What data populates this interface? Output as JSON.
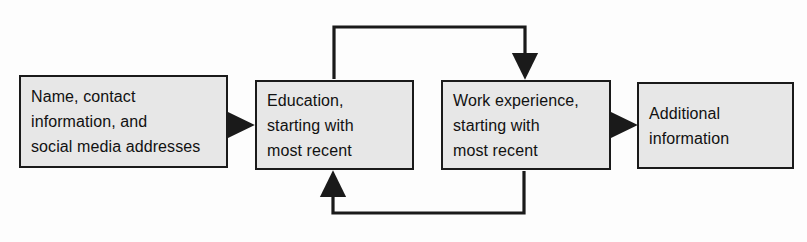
{
  "diagram": {
    "background_color": "#fdfdfd",
    "box_fill_color": "#e7e7e7",
    "box_border_color": "#1a1a1a",
    "arrow_color": "#1a1a1a",
    "boxes": [
      {
        "id": "contact",
        "name": "contact-information-box",
        "lines": [
          "Name, contact",
          "information, and",
          "social media addresses"
        ]
      },
      {
        "id": "education",
        "name": "education-box",
        "lines": [
          "Education,",
          "starting with",
          "most recent"
        ]
      },
      {
        "id": "work",
        "name": "work-experience-box",
        "lines": [
          "Work experience,",
          "starting with",
          "most recent"
        ]
      },
      {
        "id": "additional",
        "name": "additional-information-box",
        "lines": [
          "Additional",
          "information"
        ]
      }
    ],
    "connectors": [
      {
        "id": "contact-to-education",
        "from": "contact",
        "to": "education",
        "kind": "straight-arrow-right"
      },
      {
        "id": "education-to-work-top",
        "from": "education",
        "to": "work",
        "kind": "elbow-arrow-over-top"
      },
      {
        "id": "work-to-education-bottom",
        "from": "work",
        "to": "education",
        "kind": "elbow-arrow-under-bottom"
      },
      {
        "id": "work-to-additional",
        "from": "work",
        "to": "additional",
        "kind": "straight-arrow-right"
      }
    ]
  }
}
